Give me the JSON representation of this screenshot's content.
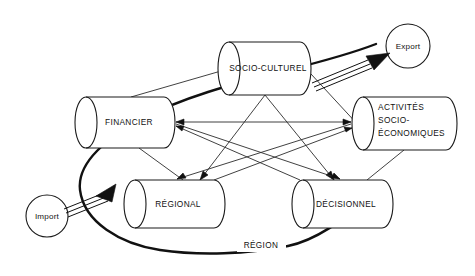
{
  "diagram": {
    "background_color": "#ffffff",
    "stroke_color": "#1a1a1a",
    "nodes": [
      {
        "id": "socio-culturel",
        "label": "SOCIO-CULTUREL",
        "shape": "cylinder",
        "x": 218,
        "y": 42,
        "width": 93,
        "height": 53
      },
      {
        "id": "financier",
        "label": "FINANCIER",
        "shape": "cylinder",
        "x": 75,
        "y": 97,
        "width": 100,
        "height": 51
      },
      {
        "id": "activites-socio-economiques",
        "label": "ACTIVITES SOCIO- ECONOMIQUES",
        "label_lines": [
          "ACTIVITÉS",
          "SOCIO-",
          "ÉCONOMIQUES"
        ],
        "shape": "cylinder",
        "x": 352,
        "y": 97,
        "width": 105,
        "height": 53
      },
      {
        "id": "regional",
        "label": "RÉGIONAL",
        "shape": "cylinder",
        "x": 124,
        "y": 180,
        "width": 101,
        "height": 48
      },
      {
        "id": "decisionnel",
        "label": "DÉCISIONNEL",
        "shape": "cylinder",
        "x": 292,
        "y": 180,
        "width": 101,
        "height": 48
      },
      {
        "id": "export",
        "label": "Export",
        "shape": "circle",
        "cx": 408,
        "cy": 46,
        "r": 22
      },
      {
        "id": "import",
        "label": "Import",
        "shape": "circle",
        "cx": 47,
        "cy": 216,
        "r": 21
      }
    ],
    "edge_labels": [
      {
        "id": "region",
        "label": "RÉGION",
        "x": 261,
        "y": 246
      }
    ],
    "flows": [
      {
        "id": "import-flow",
        "from": "import",
        "to": "regional",
        "style": "triple-line-arrow"
      },
      {
        "id": "export-flow",
        "from": "socio-culturel",
        "to": "export",
        "style": "triple-line-arrow"
      },
      {
        "id": "region-loop",
        "from": "decisionnel",
        "to": "export",
        "style": "thick-curve",
        "label": "RÉGION"
      }
    ],
    "links": [
      {
        "from": "financier",
        "to": "socio-culturel"
      },
      {
        "from": "socio-culturel",
        "to": "activites-socio-economiques"
      },
      {
        "from": "activites-socio-economiques",
        "to": "financier"
      },
      {
        "from": "financier",
        "to": "regional"
      },
      {
        "from": "socio-culturel",
        "to": "regional"
      },
      {
        "from": "socio-culturel",
        "to": "decisionnel"
      },
      {
        "from": "financier",
        "to": "decisionnel"
      },
      {
        "from": "activites-socio-economiques",
        "to": "regional"
      },
      {
        "from": "activites-socio-economiques",
        "to": "decisionnel"
      },
      {
        "from": "regional",
        "to": "activites-socio-economiques"
      },
      {
        "from": "decisionnel",
        "to": "financier"
      }
    ]
  }
}
